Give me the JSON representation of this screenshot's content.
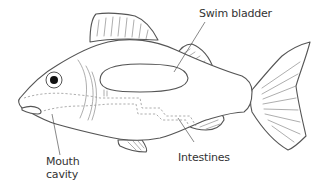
{
  "diagram": {
    "labels": {
      "swim_bladder": "Swim bladder",
      "intestines": "Intestines",
      "mouth_cavity_line1": "Mouth",
      "mouth_cavity_line2": "cavity"
    },
    "colors": {
      "outline": "#555555",
      "background": "#ffffff",
      "eye": "#111111",
      "text": "#333333"
    }
  }
}
